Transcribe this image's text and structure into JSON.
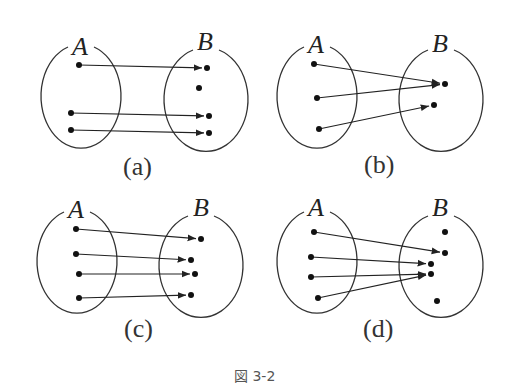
{
  "figure": {
    "caption": "図 3-2",
    "panels": [
      {
        "id": "a",
        "label": "(a)",
        "set_a_label": "A",
        "set_b_label": "B",
        "origin": [
          0,
          0
        ],
        "ellipse_a": {
          "cx": 82,
          "cy": 97,
          "rx": 40,
          "ry": 52
        },
        "ellipse_b": {
          "cx": 205,
          "cy": 100,
          "rx": 42,
          "ry": 52
        },
        "a_points": [
          [
            79,
            65
          ],
          [
            71,
            113
          ],
          [
            71,
            130
          ]
        ],
        "b_points": [
          [
            207,
            68
          ],
          [
            199,
            88
          ],
          [
            209,
            116
          ],
          [
            209,
            133
          ]
        ],
        "mappings": [
          [
            0,
            0
          ],
          [
            1,
            2
          ],
          [
            2,
            3
          ]
        ]
      },
      {
        "id": "b",
        "label": "(b)",
        "set_a_label": "A",
        "set_b_label": "B",
        "ellipse_a": {
          "cx": 318,
          "cy": 97,
          "rx": 40,
          "ry": 52
        },
        "ellipse_b": {
          "cx": 440,
          "cy": 100,
          "rx": 42,
          "ry": 52
        },
        "a_points": [
          [
            314,
            64
          ],
          [
            317,
            98
          ],
          [
            319,
            129
          ]
        ],
        "b_points": [
          [
            445,
            84
          ],
          [
            434,
            105
          ]
        ],
        "mappings": [
          [
            0,
            0
          ],
          [
            1,
            0
          ],
          [
            2,
            1
          ]
        ]
      },
      {
        "id": "c",
        "label": "(c)",
        "set_a_label": "A",
        "set_b_label": "B",
        "ellipse_a": {
          "cx": 78,
          "cy": 262,
          "rx": 40,
          "ry": 52
        },
        "ellipse_b": {
          "cx": 200,
          "cy": 266,
          "rx": 42,
          "ry": 52
        },
        "a_points": [
          [
            76,
            229
          ],
          [
            76,
            254
          ],
          [
            79,
            274
          ],
          [
            79,
            298
          ]
        ],
        "b_points": [
          [
            201,
            239
          ],
          [
            191,
            260
          ],
          [
            195,
            274
          ],
          [
            191,
            295
          ]
        ],
        "mappings": [
          [
            0,
            0
          ],
          [
            1,
            1
          ],
          [
            2,
            2
          ],
          [
            3,
            3
          ]
        ]
      },
      {
        "id": "d",
        "label": "(d)",
        "set_a_label": "A",
        "set_b_label": "B",
        "ellipse_a": {
          "cx": 318,
          "cy": 262,
          "rx": 40,
          "ry": 52
        },
        "ellipse_b": {
          "cx": 440,
          "cy": 266,
          "rx": 42,
          "ry": 52
        },
        "a_points": [
          [
            314,
            232
          ],
          [
            311,
            257
          ],
          [
            311,
            277
          ],
          [
            318,
            298
          ]
        ],
        "b_points": [
          [
            445,
            232
          ],
          [
            445,
            253
          ],
          [
            431,
            264
          ],
          [
            431,
            274
          ],
          [
            437,
            301
          ]
        ],
        "mappings": [
          [
            0,
            1
          ],
          [
            1,
            2
          ],
          [
            2,
            3
          ],
          [
            3,
            3
          ]
        ]
      }
    ]
  }
}
